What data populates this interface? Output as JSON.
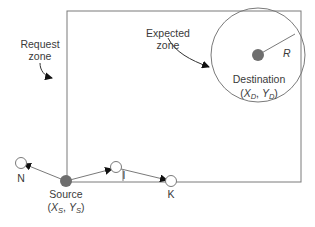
{
  "diagram": {
    "labels": {
      "request_zone_line1": "Request",
      "request_zone_line2": "zone",
      "expected_zone_line1": "Expected",
      "expected_zone_line2": "zone",
      "destination": "Destination",
      "destination_coords_open": "(",
      "destination_x": "X",
      "destination_x_sub": "D",
      "destination_sep": ", ",
      "destination_y": "Y",
      "destination_y_sub": "D",
      "destination_coords_close": ")",
      "radius": "R",
      "source": "Source",
      "source_coords_open": "(",
      "source_x": "X",
      "source_x_sub": "S",
      "source_sep": ", ",
      "source_y": "Y",
      "source_y_sub": "S",
      "source_coords_close": ")",
      "node_n": "N",
      "node_i": "I",
      "node_k": "K"
    },
    "colors": {
      "line": "#7a7a7a",
      "node_fill": "#6e6e6e",
      "arrow": "#111111",
      "text": "#3a3a3a"
    }
  }
}
